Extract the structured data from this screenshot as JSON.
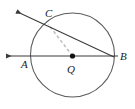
{
  "figure": {
    "background_color": "#ffffff",
    "stroke_color": "#3a3a3a",
    "dashed_color": "#b9b9b9",
    "label_color": "#1a1a1a",
    "labels": {
      "center": "Q",
      "point_a": "A",
      "point_b": "B",
      "point_c": "C"
    },
    "circle": {
      "center_x": 72.5,
      "center_y": 55,
      "radius": 42,
      "name": "circle-Q"
    },
    "points": {
      "A": {
        "x": 31,
        "y": 56,
        "label_x": 24,
        "label_y": 64
      },
      "B": {
        "x": 113.5,
        "y": 56,
        "label_x": 121,
        "label_y": 57
      },
      "C": {
        "x": 48,
        "y": 24,
        "label_x": 48,
        "label_y": 13
      },
      "Q": {
        "x": 72.5,
        "y": 56,
        "label_x": 70,
        "label_y": 69
      }
    },
    "lines": {
      "ray_ab": {
        "name": "ray-AB",
        "x1": 6,
        "y1": 56,
        "x2": 120,
        "y2": 56,
        "arrow_at": "left"
      },
      "ray_cb": {
        "name": "ray-CB",
        "x1": 16,
        "y1": 11,
        "x2": 114,
        "y2": 57,
        "arrow_at": "upper-left"
      },
      "segment_qc": {
        "name": "segment-QC",
        "x1": 72.5,
        "y1": 56,
        "x2": 48,
        "y2": 24,
        "style": "dashed"
      }
    },
    "center_dot_radius": 2.6
  }
}
